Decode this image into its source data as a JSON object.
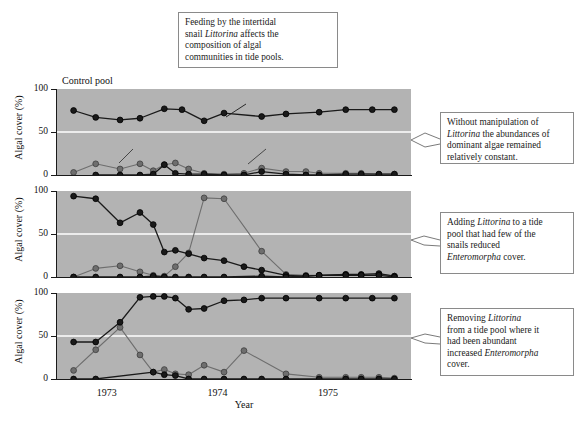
{
  "figure": {
    "caption": {
      "line1": "Feeding by the intertidal",
      "line2_a": "snail ",
      "line2_i": "Littorina",
      "line2_b": " affects the",
      "line3": "composition of algal",
      "line4": "communities in tide pools."
    },
    "notes": [
      {
        "id": "note-1",
        "line1": "Without manipulation of",
        "line2_i": "Littorina",
        "line2_b": " the abundances of",
        "line3": "dominant algae remained",
        "line4": "relatively constant."
      },
      {
        "id": "note-2",
        "line1_a": "Adding ",
        "line1_i": "Littorina",
        "line1_b": " to a tide",
        "line2": "pool that had few of the",
        "line3": "snails reduced",
        "line4_i": "Enteromorpha",
        "line4_b": " cover."
      },
      {
        "id": "note-3",
        "line1_a": "Removing ",
        "line1_i": "Littorina",
        "line2": "from a tide pool where it",
        "line3": "had been abundant",
        "line4_a": "increased ",
        "line4_i": "Enteromorpha",
        "line5": "cover."
      }
    ],
    "panel_titles": [
      "Control pool",
      "",
      ""
    ],
    "axis": {
      "y_title": "Algal cover (%)",
      "y_ticks": [
        "100",
        "50",
        "0"
      ],
      "y_values": [
        100,
        50,
        0
      ],
      "x_title": "Year",
      "x_ticks": [
        "1973",
        "1974",
        "1975"
      ],
      "x_tick_values": [
        1973,
        1974,
        1975
      ]
    },
    "series_labels": {
      "chondrus_a": "Chondrus",
      "chondrus_b": ", an unpalatable alga",
      "ephemeral": "Ephemeral algae",
      "enteromorpha": "Enteromorpha"
    },
    "colors": {
      "panel_background": "#b3b3b3",
      "gridline": "#ffffff",
      "dark_series": "#1a1a1a",
      "light_series": "#6e6e6e",
      "axis": "#1a1a1a",
      "box_border": "#8a8a8a",
      "page": "#ffffff"
    }
  },
  "chart_data": {
    "type": "line",
    "title": "Feeding by the intertidal snail Littorina affects the composition of algal communities in tide pools.",
    "xlabel": "Year",
    "ylabel": "Algal cover (%)",
    "ylim": [
      0,
      100
    ],
    "xlim": [
      1972.55,
      1975.75
    ],
    "grid": "horizontal gridline at y = 50 (white)",
    "legend": "inline series labels with leader lines",
    "panels": [
      {
        "name": "Control pool",
        "title": "Control pool",
        "series": [
          {
            "name": "Chondrus, an unpalatable alga",
            "style": "dark-filled-circle",
            "color": "#1a1a1a",
            "x": [
              1972.7,
              1972.9,
              1973.12,
              1973.3,
              1973.52,
              1973.68,
              1973.88,
              1974.06,
              1974.4,
              1974.62,
              1974.92,
              1975.16,
              1975.4,
              1975.6
            ],
            "y": [
              75,
              67,
              64,
              66,
              77,
              76,
              63,
              72,
              68,
              71,
              73,
              76,
              76,
              76
            ]
          },
          {
            "name": "Ephemeral algae",
            "style": "grey-filled-circle",
            "color": "#6e6e6e",
            "x": [
              1972.7,
              1972.9,
              1973.12,
              1973.3,
              1973.42,
              1973.52,
              1973.62,
              1973.74,
              1973.88,
              1974.06,
              1974.24,
              1974.4,
              1974.62,
              1974.8,
              1974.92,
              1975.16,
              1975.3,
              1975.46,
              1975.6
            ],
            "y": [
              3,
              13,
              7,
              13,
              5,
              12,
              14,
              7,
              2,
              1,
              2,
              8,
              4,
              4,
              2,
              2,
              2,
              1,
              1
            ]
          },
          {
            "name": "Littorina / baseline dark low series",
            "style": "dark-filled-circle",
            "color": "#1a1a1a",
            "x": [
              1972.9,
              1973.12,
              1973.3,
              1973.42,
              1973.52,
              1973.62,
              1973.74,
              1973.88,
              1974.06,
              1974.24,
              1974.4,
              1974.62,
              1974.8,
              1974.92,
              1975.16,
              1975.3,
              1975.46,
              1975.6
            ],
            "y": [
              0,
              0,
              0,
              1,
              12,
              2,
              1,
              1,
              0,
              0,
              4,
              1,
              0,
              0,
              1,
              1,
              1,
              1
            ]
          }
        ]
      },
      {
        "name": "Littorina added",
        "title": "",
        "series": [
          {
            "name": "Chondrus / dominant alga (declining)",
            "style": "dark-filled-circle",
            "color": "#1a1a1a",
            "x": [
              1972.7,
              1972.9,
              1973.12,
              1973.3,
              1973.42,
              1973.52,
              1973.62,
              1973.74,
              1973.88,
              1974.06,
              1974.24,
              1974.4,
              1974.62,
              1974.8,
              1974.92,
              1975.16,
              1975.3,
              1975.46,
              1975.6
            ],
            "y": [
              94,
              91,
              63,
              75,
              61,
              29,
              31,
              27,
              22,
              19,
              12,
              8,
              2,
              1,
              2,
              3,
              3,
              4,
              1
            ]
          },
          {
            "name": "Enteromorpha",
            "style": "grey-filled-circle",
            "color": "#6e6e6e",
            "x": [
              1972.7,
              1972.9,
              1973.12,
              1973.3,
              1973.42,
              1973.52,
              1973.62,
              1973.74,
              1973.88,
              1974.06,
              1974.4,
              1974.62,
              1974.8,
              1974.92,
              1975.16,
              1975.3,
              1975.46,
              1975.6
            ],
            "y": [
              0,
              10,
              13,
              6,
              2,
              1,
              12,
              28,
              92,
              91,
              30,
              3,
              2,
              2,
              3,
              2,
              3,
              1
            ]
          },
          {
            "name": "Littorina / low baseline dark series",
            "style": "dark-filled-circle",
            "color": "#1a1a1a",
            "x": [
              1972.7,
              1972.9,
              1973.12,
              1973.3,
              1973.42,
              1973.52,
              1973.62,
              1973.74,
              1973.88,
              1974.06,
              1974.4,
              1974.62,
              1974.8,
              1974.92,
              1975.16,
              1975.3,
              1975.46,
              1975.6
            ],
            "y": [
              0,
              0,
              0,
              0,
              1,
              0,
              0,
              0,
              0,
              0,
              1,
              0,
              1,
              2,
              2,
              2,
              2,
              0
            ]
          }
        ]
      },
      {
        "name": "Littorina removed",
        "title": "",
        "series": [
          {
            "name": "Chondrus / dominant alga (increasing)",
            "style": "dark-filled-circle",
            "color": "#1a1a1a",
            "x": [
              1972.7,
              1972.9,
              1973.12,
              1973.3,
              1973.42,
              1973.52,
              1973.62,
              1973.74,
              1973.88,
              1974.06,
              1974.24,
              1974.4,
              1974.62,
              1974.92,
              1975.16,
              1975.4,
              1975.6
            ],
            "y": [
              43,
              43,
              66,
              95,
              96,
              96,
              94,
              81,
              82,
              91,
              92,
              94,
              94,
              94,
              94,
              94,
              94
            ]
          },
          {
            "name": "Enteromorpha",
            "style": "grey-filled-circle",
            "color": "#6e6e6e",
            "x": [
              1972.7,
              1972.9,
              1973.12,
              1973.3,
              1973.42,
              1973.52,
              1973.62,
              1973.74,
              1973.88,
              1974.06,
              1974.24,
              1974.62,
              1974.92,
              1975.16,
              1975.3,
              1975.46,
              1975.6
            ],
            "y": [
              10,
              34,
              60,
              28,
              8,
              11,
              6,
              5,
              16,
              8,
              33,
              6,
              2,
              2,
              2,
              2,
              1
            ]
          },
          {
            "name": "Littorina / removed (zero) dark series",
            "style": "dark-filled-circle",
            "color": "#1a1a1a",
            "x": [
              1972.7,
              1972.9,
              1973.42,
              1973.52,
              1973.62,
              1973.74,
              1973.88,
              1974.06,
              1974.24,
              1974.4,
              1974.62,
              1974.92,
              1975.16,
              1975.3,
              1975.46,
              1975.6
            ],
            "y": [
              0,
              0,
              8,
              5,
              4,
              0,
              0,
              0,
              0,
              0,
              0,
              0,
              0,
              0,
              0,
              0
            ]
          }
        ]
      }
    ]
  }
}
